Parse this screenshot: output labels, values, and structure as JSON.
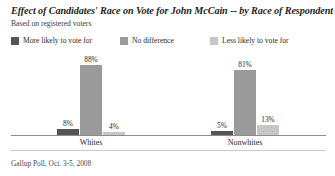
{
  "chart_data": {
    "type": "bar",
    "title": "Effect of Candidates' Race on Vote for John McCain -- by Race of Respondent",
    "subtitle": "Based on registered voters",
    "source": "Gallup Poll, Oct. 3-5, 2008",
    "categories": [
      "Whites",
      "Nonwhites"
    ],
    "series": [
      {
        "name": "More likely to vote for",
        "color": "#555555",
        "values": [
          8,
          5
        ],
        "labels": [
          "8%",
          "5%"
        ]
      },
      {
        "name": "No difference",
        "color": "#9a9a9a",
        "values": [
          88,
          81
        ],
        "labels": [
          "88%",
          "81%"
        ]
      },
      {
        "name": "Less likely to vote for",
        "color": "#c6c6c6",
        "values": [
          4,
          13
        ],
        "labels": [
          "4%",
          "13%"
        ]
      }
    ],
    "xlabel": "",
    "ylabel": "",
    "ylim": [
      0,
      100
    ],
    "grid": false,
    "legend_position": "top-left",
    "value_labels": true,
    "units": "percent"
  }
}
